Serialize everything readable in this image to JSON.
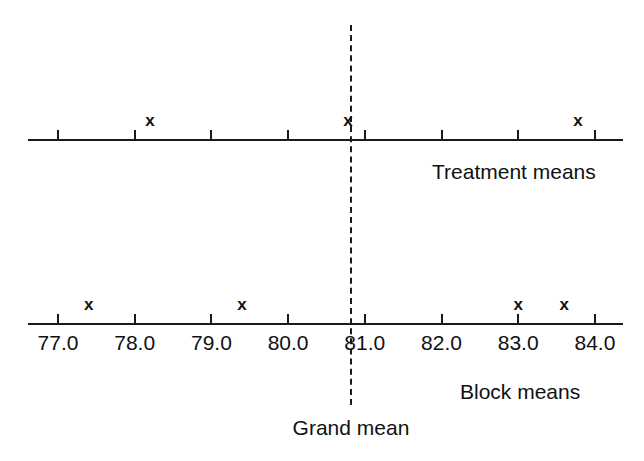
{
  "chart_data": {
    "type": "scatter",
    "title": "",
    "xlabel": "",
    "ylabel": "",
    "xlim": [
      76.6,
      84.4
    ],
    "grid": false,
    "legend_position": "none",
    "axis_tick_labels": [
      "77.0",
      "78.0",
      "79.0",
      "80.0",
      "81.0",
      "82.0",
      "83.0",
      "84.0"
    ],
    "axis_tick_values": [
      77.0,
      78.0,
      79.0,
      80.0,
      81.0,
      82.0,
      83.0,
      84.0
    ],
    "series": [
      {
        "name": "Treatment means",
        "marker": "x",
        "values": [
          78.2,
          80.78,
          83.78
        ]
      },
      {
        "name": "Block means",
        "marker": "x",
        "values": [
          77.4,
          79.4,
          83.0,
          83.6
        ]
      }
    ],
    "annotations": [
      {
        "name": "Grand mean",
        "value": 80.82,
        "style": "dashed-vertical-line"
      }
    ]
  },
  "labels": {
    "treatment_means": "Treatment means",
    "block_means": "Block means",
    "grand_mean": "Grand mean",
    "marker_glyph": "x"
  },
  "colors": {
    "ink": "#1a1a1a",
    "background": "#ffffff"
  }
}
